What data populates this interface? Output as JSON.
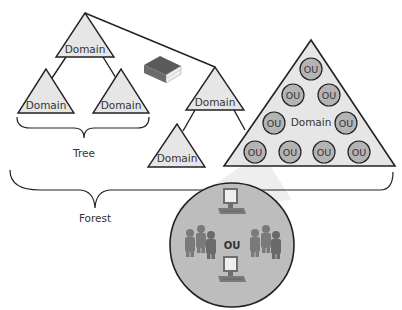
{
  "colors": {
    "triangle_fill": "#e6e6e6",
    "stroke": "#222222",
    "ou_fill": "#b4b4b4",
    "big_circle_fill": "#bdbdbd",
    "beam_fill": "#eeeeee",
    "book_cover": "#6b6b6b",
    "book_pages": "#f0f0f0",
    "person_fill": "#7a7a7a",
    "computer_fill": "#808080"
  },
  "labels": {
    "tree": "Tree",
    "forest": "Forest",
    "domain_root": "Domain",
    "domain_left_child": "Domain",
    "domain_right_child": "Domain",
    "domain_middle": "Domain",
    "domain_lower": "Domain",
    "domain_large": "Domain",
    "ou_detail": "OU"
  },
  "ous": [
    {
      "label": "OU"
    },
    {
      "label": "OU"
    },
    {
      "label": "OU"
    },
    {
      "label": "OU"
    },
    {
      "label": "OU"
    },
    {
      "label": "OU"
    },
    {
      "label": "OU"
    },
    {
      "label": "OU"
    },
    {
      "label": "OU"
    }
  ],
  "icons": {
    "book": "schema-book-icon",
    "computer": "computer-icon",
    "users": "user-group-icon"
  }
}
